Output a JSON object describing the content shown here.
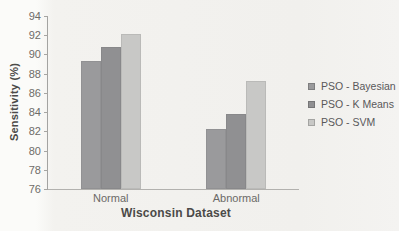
{
  "figure": {
    "background": "#f2f1ee"
  },
  "chart_data": {
    "type": "bar",
    "title": "",
    "categories": [
      "Normal",
      "Abnormal"
    ],
    "series": [
      {
        "name": "PSO - Bayesian",
        "color": "#9a9a9c",
        "values": [
          89.3,
          82.2
        ]
      },
      {
        "name": "PSO - K Means",
        "color": "#909092",
        "values": [
          90.8,
          83.8
        ]
      },
      {
        "name": "PSO - SVM",
        "color": "#c8c8c6",
        "values": [
          92.1,
          87.2
        ]
      }
    ],
    "xlabel": "Wisconsin Dataset",
    "ylabel": "Sensitivity (%)",
    "ylim": [
      76,
      94
    ],
    "ytick_step": 2,
    "grid": false,
    "legend_position": "right",
    "axis_color": "#a3a3a1",
    "tick_text_color": "#6e6c68",
    "title_text_color": "#4b4a48",
    "legend_text_color": "#59585a"
  }
}
